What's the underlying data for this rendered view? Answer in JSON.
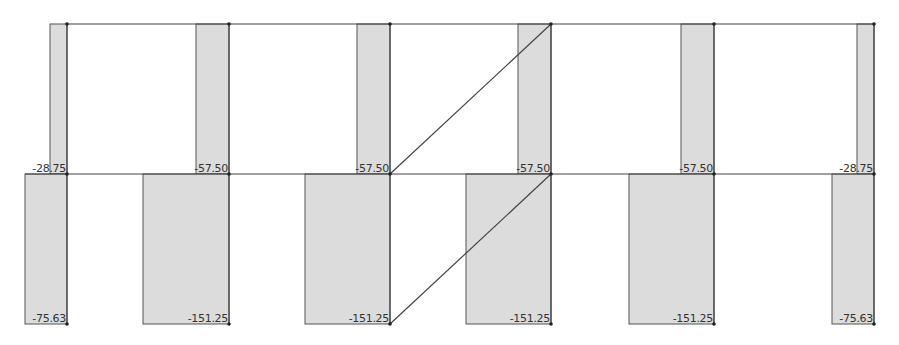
{
  "diagram": {
    "type": "axial-force-diagram",
    "colors": {
      "fill": "#dcdcdc",
      "stroke": "#555555",
      "line": "#444444",
      "node": "#222222",
      "text": "#333333"
    },
    "levels": [
      {
        "name": "upper-story",
        "top_y": 24,
        "base_y": 174
      },
      {
        "name": "lower-story",
        "top_y": 174,
        "base_y": 324
      }
    ],
    "columns_x": [
      67,
      229,
      390,
      551,
      714,
      874
    ],
    "upper": [
      {
        "label": "-28.75",
        "value": -28.75,
        "x": 50,
        "width": 17
      },
      {
        "label": "-57.50",
        "value": -57.5,
        "x": 196,
        "width": 33
      },
      {
        "label": "-57.50",
        "value": -57.5,
        "x": 357,
        "width": 33
      },
      {
        "label": "-57.50",
        "value": -57.5,
        "x": 518,
        "width": 33
      },
      {
        "label": "-57.50",
        "value": -57.5,
        "x": 681,
        "width": 33
      },
      {
        "label": "-28.75",
        "value": -28.75,
        "x": 857,
        "width": 17
      }
    ],
    "lower": [
      {
        "label": "-75.63",
        "value": -75.63,
        "x": 25,
        "width": 42
      },
      {
        "label": "-151.25",
        "value": -151.25,
        "x": 143,
        "width": 86
      },
      {
        "label": "-151.25",
        "value": -151.25,
        "x": 305,
        "width": 85
      },
      {
        "label": "-151.25",
        "value": -151.25,
        "x": 466,
        "width": 85
      },
      {
        "label": "-151.25",
        "value": -151.25,
        "x": 629,
        "width": 85
      },
      {
        "label": "-75.63",
        "value": -75.63,
        "x": 832,
        "width": 42
      }
    ],
    "braces": [
      {
        "from": [
          390,
          174
        ],
        "to": [
          551,
          24
        ]
      },
      {
        "from": [
          390,
          324
        ],
        "to": [
          551,
          174
        ]
      }
    ]
  }
}
